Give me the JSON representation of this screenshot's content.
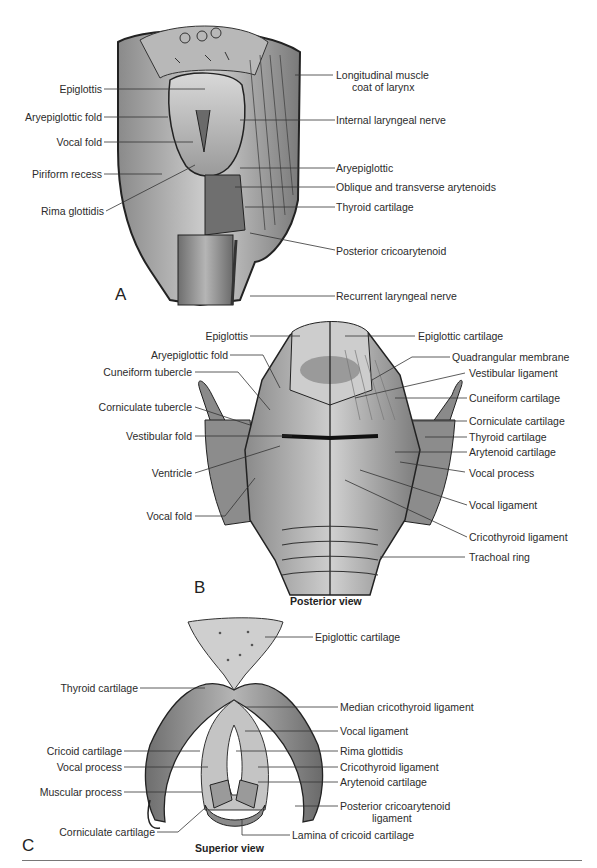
{
  "figure": {
    "panels": [
      {
        "id": "A",
        "letter": "A",
        "caption": "",
        "labels_left": [
          "Epiglottis",
          "Aryepiglottic fold",
          "Vocal fold",
          "Piriform recess",
          "Rima glottidis"
        ],
        "labels_right": [
          "Longitudinal muscle",
          "coat of larynx",
          "Internal laryngeal nerve",
          "Aryepiglottic",
          "Oblique and transverse arytenoids",
          "Thyroid cartilage",
          "Posterior cricoarytenoid",
          "Recurrent laryngeal nerve"
        ]
      },
      {
        "id": "B",
        "letter": "B",
        "caption": "Posterior view",
        "labels_left": [
          "Epiglottis",
          "Aryepiglottic fold",
          "Cuneiform tubercle",
          "Corniculate tubercle",
          "Vestibular fold",
          "Ventricle",
          "Vocal fold"
        ],
        "labels_right": [
          "Epiglottic cartilage",
          "Quadrangular membrane",
          "Vestibular ligament",
          "Cuneiform cartilage",
          "Corniculate cartilage",
          "Thyroid cartilage",
          "Arytenoid cartilage",
          "Vocal process",
          "Vocal ligament",
          "Cricothyroid ligament",
          "Trachoal ring"
        ]
      },
      {
        "id": "C",
        "letter": "C",
        "caption": "Superior view",
        "labels_left": [
          "Thyroid cartilage",
          "Cricoid cartilage",
          "Vocal process",
          "Muscular process",
          "Corniculate cartilage"
        ],
        "labels_right": [
          "Epiglottic cartilage",
          "Median cricothyroid ligament",
          "Vocal ligament",
          "Rima glottidis",
          "Cricothyroid ligament",
          "Arytenoid cartilage",
          "Posterior cricoarytenoid",
          "ligament",
          "Lamina of cricoid cartilage"
        ]
      }
    ]
  }
}
